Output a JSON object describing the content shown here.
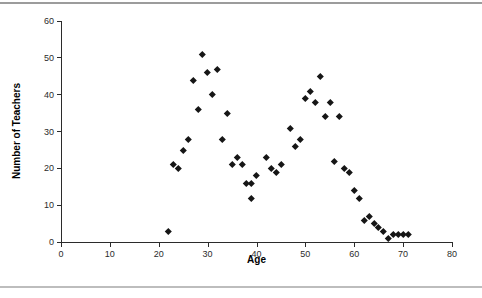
{
  "figure": {
    "top_rule_color": "#9c9c9c",
    "bottom_rule_color": "#bdbdbd",
    "background_color": "#ffffff"
  },
  "chart_data": {
    "type": "scatter",
    "title": "",
    "xlabel": "Age",
    "ylabel": "Number of Teachers",
    "xlim": [
      0,
      80
    ],
    "ylim": [
      0,
      60
    ],
    "x_ticks": [
      0,
      10,
      20,
      30,
      40,
      50,
      60,
      70,
      80
    ],
    "y_ticks": [
      0,
      10,
      20,
      30,
      40,
      50,
      60
    ],
    "grid": false,
    "legend": "none",
    "marker": {
      "shape": "diamond",
      "color": "#161616",
      "size_px": 5
    },
    "points": [
      [
        22,
        3
      ],
      [
        23,
        21
      ],
      [
        24,
        20
      ],
      [
        25,
        25
      ],
      [
        26,
        28
      ],
      [
        27,
        44
      ],
      [
        28,
        36
      ],
      [
        29,
        51
      ],
      [
        30,
        46
      ],
      [
        31,
        40
      ],
      [
        32,
        47
      ],
      [
        33,
        28
      ],
      [
        34,
        35
      ],
      [
        35,
        21
      ],
      [
        36,
        23
      ],
      [
        37,
        21
      ],
      [
        38,
        16
      ],
      [
        39,
        16
      ],
      [
        39,
        12
      ],
      [
        40,
        18
      ],
      [
        42,
        23
      ],
      [
        43,
        20
      ],
      [
        44,
        19
      ],
      [
        45,
        21
      ],
      [
        47,
        31
      ],
      [
        48,
        26
      ],
      [
        49,
        28
      ],
      [
        50,
        39
      ],
      [
        51,
        41
      ],
      [
        52,
        38
      ],
      [
        53,
        45
      ],
      [
        54,
        34
      ],
      [
        55,
        38
      ],
      [
        56,
        22
      ],
      [
        57,
        34
      ],
      [
        58,
        20
      ],
      [
        59,
        19
      ],
      [
        60,
        14
      ],
      [
        61,
        12
      ],
      [
        62,
        6
      ],
      [
        63,
        7
      ],
      [
        64,
        5
      ],
      [
        65,
        4
      ],
      [
        66,
        3
      ],
      [
        67,
        1
      ],
      [
        68,
        2
      ],
      [
        69,
        2
      ],
      [
        70,
        2
      ],
      [
        71,
        2
      ]
    ]
  }
}
